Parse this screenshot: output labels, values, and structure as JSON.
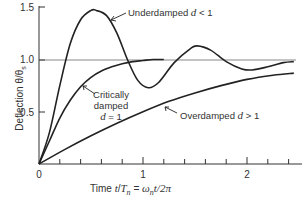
{
  "chart_data": {
    "type": "line",
    "title": "",
    "xlabel": "Time t/T_n = ω_n t/2π",
    "ylabel": "Deflection θ/θ_s",
    "xlim": [
      0,
      2.5
    ],
    "ylim": [
      0,
      1.5
    ],
    "x_ticks": [
      0,
      1,
      2
    ],
    "x_minor_ticks": [
      0.2,
      0.4,
      0.6,
      0.8,
      1.2,
      1.4,
      1.6,
      1.8,
      2.2,
      2.4
    ],
    "y_ticks": [
      0.5,
      1.0,
      1.5
    ],
    "reference_line": {
      "y": 1.0
    },
    "grid": false,
    "legend": "inline annotations",
    "series": [
      {
        "name": "Underdamped d < 1",
        "x": [
          0,
          0.1,
          0.2,
          0.3,
          0.4,
          0.5,
          0.55,
          0.65,
          0.75,
          0.85,
          0.95,
          1.05,
          1.15,
          1.3,
          1.45,
          1.52,
          1.65,
          1.8,
          1.95,
          2.05,
          2.2,
          2.35,
          2.45
        ],
        "values": [
          0,
          0.3,
          0.75,
          1.15,
          1.38,
          1.47,
          1.47,
          1.42,
          1.25,
          1.0,
          0.8,
          0.73,
          0.78,
          0.97,
          1.1,
          1.13,
          1.09,
          0.98,
          0.91,
          0.9,
          0.93,
          0.97,
          0.98
        ]
      },
      {
        "name": "Critically damped d = 1",
        "x": [
          0,
          0.1,
          0.2,
          0.3,
          0.4,
          0.5,
          0.6,
          0.7,
          0.8,
          0.9,
          1.0,
          1.1,
          1.2
        ],
        "values": [
          0,
          0.22,
          0.44,
          0.61,
          0.74,
          0.83,
          0.89,
          0.93,
          0.96,
          0.98,
          0.99,
          1.0,
          1.0
        ]
      },
      {
        "name": "Overdamped d > 1",
        "x": [
          0,
          0.25,
          0.5,
          0.75,
          1.0,
          1.25,
          1.5,
          1.75,
          2.0,
          2.25,
          2.45
        ],
        "values": [
          0,
          0.14,
          0.27,
          0.39,
          0.5,
          0.6,
          0.68,
          0.75,
          0.81,
          0.85,
          0.87
        ]
      }
    ],
    "annotations": [
      {
        "text": "Underdamped d < 1",
        "points_to": "Underdamped d < 1"
      },
      {
        "text": "Critically damped d = 1",
        "points_to": "Critically damped d = 1"
      },
      {
        "text": "Overdamped d > 1",
        "points_to": "Overdamped d > 1"
      }
    ]
  },
  "labels": {
    "y_tick_15": "1.5",
    "y_tick_10": "1.0",
    "y_tick_05": "0.5",
    "x_tick_0": "0",
    "x_tick_1": "1",
    "x_tick_2": "2",
    "ylabel_text": "Deflection θ/θ",
    "ylabel_sub": "s",
    "xlabel_pre": "Time ",
    "xlabel_t": "t",
    "xlabel_slash": "/",
    "xlabel_T": "T",
    "xlabel_n": "n",
    "xlabel_eq": " = ",
    "xlabel_omega": "ω",
    "xlabel_n2": "n",
    "xlabel_rest": "t/2π",
    "under_text": "Underdamped ",
    "under_d": "d",
    "under_rel": " < 1",
    "crit_line1": "Critically",
    "crit_line2": "damped",
    "crit_d": "d",
    "crit_rel": " = 1",
    "over_text": "Overdamped ",
    "over_d": "d",
    "over_rel": " > 1"
  }
}
